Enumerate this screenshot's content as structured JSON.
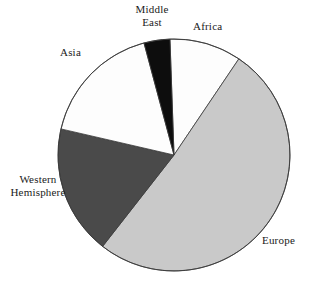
{
  "chart_data": {
    "type": "pie",
    "title": "",
    "subtitle": "",
    "xlabel": "",
    "ylabel": "",
    "grid": false,
    "legend_position": "none",
    "label_placement": "outside-callout",
    "categories": [
      "Africa",
      "Europe",
      "Western Hemisphere",
      "Asia",
      "Middle East"
    ],
    "values": [
      10,
      51,
      18,
      17,
      4
    ],
    "units": "percent",
    "start_angle_deg": -2,
    "direction": "clockwise",
    "slices": [
      {
        "label": "Africa",
        "value": 10,
        "color": "#fdfdfd",
        "start_angle_deg": -2,
        "end_angle_deg": 34
      },
      {
        "label": "Europe",
        "value": 51,
        "color": "#c9c9c9",
        "start_angle_deg": 34,
        "end_angle_deg": 218
      },
      {
        "label": "Western\nHemisphere",
        "value": 18,
        "color": "#4a4a4a",
        "start_angle_deg": 218,
        "end_angle_deg": 283
      },
      {
        "label": "Asia",
        "value": 17,
        "color": "#fdfdfd",
        "start_angle_deg": 283,
        "end_angle_deg": 345
      },
      {
        "label": "Middle\nEast",
        "value": 4,
        "color": "#0d0d0d",
        "start_angle_deg": 345,
        "end_angle_deg": 358
      }
    ]
  },
  "labels": {
    "middle_east": "Middle\nEast",
    "africa": "Africa",
    "asia": "Asia",
    "western_hemisphere": "Western\nHemisphere",
    "europe": "Europe"
  },
  "geometry": {
    "center_x": 174,
    "center_y": 155,
    "radius": 116
  },
  "colors": {
    "background": "#ffffff",
    "outline": "#3a3a3a",
    "slice_white": "#fdfdfd",
    "slice_light_gray": "#c9c9c9",
    "slice_dark_gray": "#4a4a4a",
    "slice_black": "#0d0d0d",
    "text": "#1a1a1a"
  }
}
